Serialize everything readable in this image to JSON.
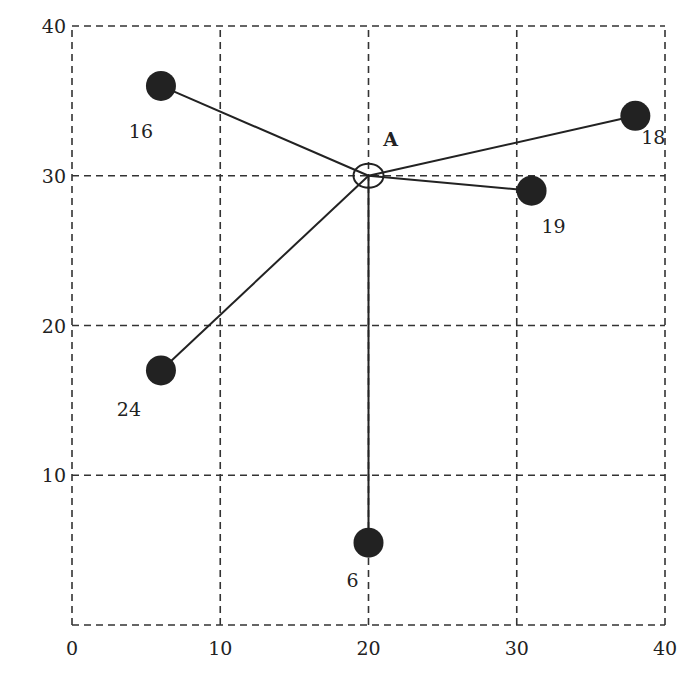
{
  "chart_data": {
    "type": "scatter",
    "title": "",
    "xlabel": "",
    "ylabel": "",
    "xlim": [
      0,
      40
    ],
    "ylim": [
      0,
      40
    ],
    "grid": true,
    "grid_style": "dashed",
    "x_ticks": [
      "0",
      "10",
      "20",
      "30",
      "40"
    ],
    "y_ticks": [
      "10",
      "20",
      "30",
      "40"
    ],
    "center": {
      "label": "A",
      "x": 20,
      "y": 30
    },
    "points": [
      {
        "label": "16",
        "x": 6,
        "y": 36
      },
      {
        "label": "18",
        "x": 38,
        "y": 34
      },
      {
        "label": "19",
        "x": 31,
        "y": 29
      },
      {
        "label": "24",
        "x": 6,
        "y": 17
      },
      {
        "label": "6",
        "x": 20,
        "y": 5.5
      }
    ],
    "connections": "each point connected by a straight line to center A"
  },
  "colors": {
    "ink": "#222222",
    "grid": "#333333",
    "background": "#ffffff"
  }
}
